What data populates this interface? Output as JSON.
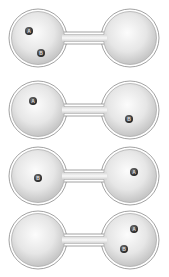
{
  "diagram": {
    "colors": {
      "background": "#ffffff",
      "bulb_fill_light": "#fafafa",
      "bulb_fill_dark": "#c8c8c8",
      "outline": "#8a8a8a",
      "particle": "#3a3a3a",
      "particle_label": "#dddddd"
    },
    "configurations": [
      {
        "index": 1,
        "left_bulb": [
          "A",
          "B"
        ],
        "right_bulb": []
      },
      {
        "index": 2,
        "left_bulb": [
          "A"
        ],
        "right_bulb": [
          "B"
        ]
      },
      {
        "index": 3,
        "left_bulb": [
          "B"
        ],
        "right_bulb": [
          "A"
        ]
      },
      {
        "index": 4,
        "left_bulb": [],
        "right_bulb": [
          "A",
          "B"
        ]
      }
    ],
    "particles": {
      "row1": {
        "a": "A",
        "b": "B"
      },
      "row2": {
        "a": "A",
        "b": "B"
      },
      "row3": {
        "a": "A",
        "b": "B"
      },
      "row4": {
        "a": "A",
        "b": "B"
      }
    }
  }
}
